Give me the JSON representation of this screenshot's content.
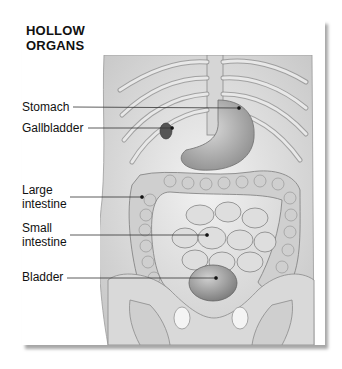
{
  "title": {
    "line1": "HOLLOW",
    "line2": "ORGANS"
  },
  "labels": [
    {
      "id": "stomach",
      "lines": [
        "Stomach"
      ]
    },
    {
      "id": "gallbladder",
      "lines": [
        "Gallbladder"
      ]
    },
    {
      "id": "large-intestine",
      "lines": [
        "Large",
        "intestine"
      ]
    },
    {
      "id": "small-intestine",
      "lines": [
        "Small",
        "intestine"
      ]
    },
    {
      "id": "bladder",
      "lines": [
        "Bladder"
      ]
    }
  ],
  "colors": {
    "line": "#333333",
    "bone": "#dcdcdc",
    "tissue": "#e6e6e6",
    "outline": "#8a8a8a",
    "organ_dark": "#9a9a9a"
  }
}
